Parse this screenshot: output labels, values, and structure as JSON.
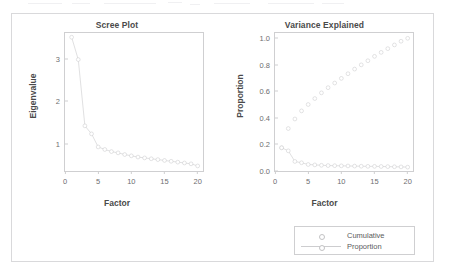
{
  "figure": {
    "panel_border_color": "#d9d9db",
    "background": "#ffffff",
    "series_color": "#c6c6c8",
    "text_color": "#4a4a4a"
  },
  "legend": {
    "position": "bottom-right",
    "items": [
      {
        "label": "Cumulative",
        "style": "marker-only"
      },
      {
        "label": "Proportion",
        "style": "line-marker"
      }
    ]
  },
  "chart_data": [
    {
      "type": "line",
      "id": "scree-plot",
      "title": "Scree Plot",
      "xlabel": "Factor",
      "ylabel": "Eigenvalue",
      "xlim": [
        0,
        20.8
      ],
      "ylim": [
        0.35,
        3.62
      ],
      "xticks": [
        0,
        5,
        10,
        15,
        20
      ],
      "yticks": [
        1,
        2,
        3
      ],
      "grid": false,
      "legend": "none",
      "marker": "open-circle",
      "x": [
        1,
        2,
        3,
        4,
        5,
        6,
        7,
        8,
        9,
        10,
        11,
        12,
        13,
        14,
        15,
        16,
        17,
        18,
        19,
        20
      ],
      "values": [
        3.52,
        2.99,
        1.42,
        1.23,
        0.92,
        0.86,
        0.81,
        0.78,
        0.74,
        0.71,
        0.68,
        0.66,
        0.64,
        0.62,
        0.6,
        0.58,
        0.56,
        0.54,
        0.52,
        0.47
      ]
    },
    {
      "type": "line",
      "id": "variance-explained",
      "title": "Variance Explained",
      "xlabel": "Factor",
      "ylabel": "Proportion",
      "xlim": [
        0,
        20.8
      ],
      "ylim": [
        0.0,
        1.04
      ],
      "xticks": [
        0,
        5,
        10,
        15,
        20
      ],
      "yticks": [
        0.0,
        0.2,
        0.4,
        0.6,
        0.8,
        1.0
      ],
      "ytick_labels": [
        "0.0",
        "0.2",
        "0.4",
        "0.6",
        "0.8",
        "1.0"
      ],
      "grid": false,
      "legend": "bottom-right",
      "marker": "open-circle",
      "x": [
        1,
        2,
        3,
        4,
        5,
        6,
        7,
        8,
        9,
        10,
        11,
        12,
        13,
        14,
        15,
        16,
        17,
        18,
        19,
        20
      ],
      "series": [
        {
          "name": "Cumulative",
          "style": "marker-only",
          "values": [
            0.175,
            0.32,
            0.392,
            0.453,
            0.501,
            0.546,
            0.589,
            0.628,
            0.663,
            0.698,
            0.733,
            0.768,
            0.8,
            0.831,
            0.864,
            0.894,
            0.922,
            0.95,
            0.978,
            1.0
          ]
        },
        {
          "name": "Proportion",
          "style": "line-marker",
          "values": [
            0.175,
            0.152,
            0.072,
            0.062,
            0.049,
            0.046,
            0.043,
            0.041,
            0.04,
            0.039,
            0.038,
            0.037,
            0.036,
            0.035,
            0.035,
            0.034,
            0.033,
            0.032,
            0.031,
            0.029
          ]
        }
      ]
    }
  ]
}
